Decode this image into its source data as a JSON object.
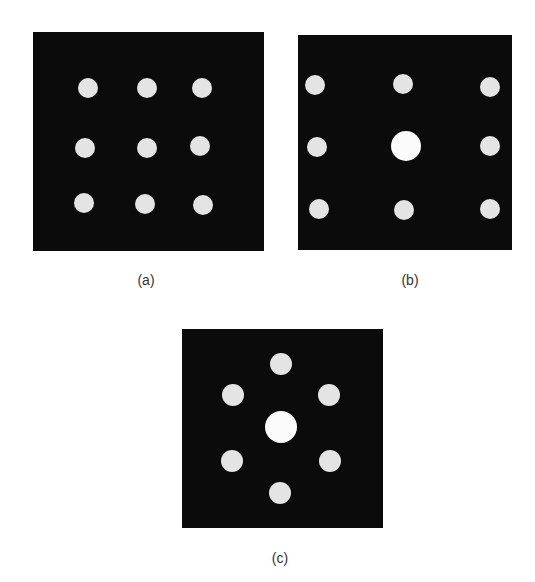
{
  "figure": {
    "background": "#ffffff",
    "panel_color": "#0b0b0b",
    "dot_color": "#e4e4e4",
    "center_dot_color": "#fbfbfb",
    "panels": [
      {
        "id": "a",
        "label": "(a)",
        "box": {
          "x": 33,
          "y": 32,
          "w": 231,
          "h": 219
        },
        "label_pos": {
          "x": 146,
          "y": 272
        },
        "dots": [
          {
            "cx": 88,
            "cy": 88,
            "r": 10
          },
          {
            "cx": 147,
            "cy": 88,
            "r": 10
          },
          {
            "cx": 202,
            "cy": 88,
            "r": 10
          },
          {
            "cx": 85,
            "cy": 148,
            "r": 10
          },
          {
            "cx": 147,
            "cy": 148,
            "r": 10
          },
          {
            "cx": 200,
            "cy": 146,
            "r": 10
          },
          {
            "cx": 84,
            "cy": 203,
            "r": 10
          },
          {
            "cx": 145,
            "cy": 204,
            "r": 10
          },
          {
            "cx": 203,
            "cy": 205,
            "r": 10
          }
        ]
      },
      {
        "id": "b",
        "label": "(b)",
        "box": {
          "x": 298,
          "y": 35,
          "w": 214,
          "h": 215
        },
        "label_pos": {
          "x": 410,
          "y": 272
        },
        "dots": [
          {
            "cx": 315,
            "cy": 85,
            "r": 10
          },
          {
            "cx": 403,
            "cy": 84,
            "r": 10
          },
          {
            "cx": 490,
            "cy": 87,
            "r": 10
          },
          {
            "cx": 317,
            "cy": 147,
            "r": 10
          },
          {
            "cx": 406,
            "cy": 146,
            "r": 15,
            "center": true
          },
          {
            "cx": 490,
            "cy": 146,
            "r": 10
          },
          {
            "cx": 319,
            "cy": 209,
            "r": 10
          },
          {
            "cx": 404,
            "cy": 210,
            "r": 10
          },
          {
            "cx": 490,
            "cy": 209,
            "r": 10
          }
        ]
      },
      {
        "id": "c",
        "label": "(c)",
        "box": {
          "x": 182,
          "y": 329,
          "w": 201,
          "h": 199
        },
        "label_pos": {
          "x": 280,
          "y": 550
        },
        "dots": [
          {
            "cx": 281,
            "cy": 364,
            "r": 11
          },
          {
            "cx": 233,
            "cy": 395,
            "r": 11
          },
          {
            "cx": 329,
            "cy": 395,
            "r": 11
          },
          {
            "cx": 281,
            "cy": 427,
            "r": 16,
            "center": true
          },
          {
            "cx": 232,
            "cy": 461,
            "r": 11
          },
          {
            "cx": 330,
            "cy": 461,
            "r": 11
          },
          {
            "cx": 280,
            "cy": 493,
            "r": 11
          }
        ]
      }
    ]
  }
}
